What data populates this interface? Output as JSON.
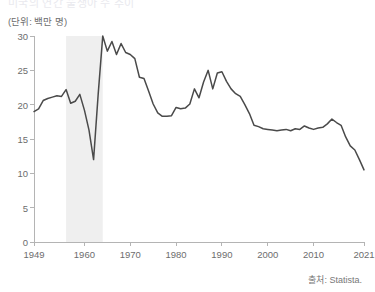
{
  "header": {
    "title": "미국의 연간 출생아 수 추이",
    "unit_label": "(단위: 백만 명)"
  },
  "footer": {
    "source": "출처: Statista."
  },
  "axes": {
    "y_ticks": [
      "0",
      "5",
      "10",
      "15",
      "20",
      "25",
      "30"
    ],
    "x_ticks": [
      "1949",
      "1960",
      "1970",
      "1980",
      "1990",
      "2000",
      "2010",
      "2021"
    ]
  },
  "colors": {
    "line": "#4a4a4a",
    "band": "#efefef",
    "axis": "#b4b4b4",
    "text": "#6d6d6d"
  },
  "chart_data": {
    "type": "line",
    "title": "미국의 연간 출생아 수 추이",
    "xlabel": "",
    "ylabel": "백만 명",
    "unit": "백만 명",
    "source": "출처: Statista.",
    "xlim": [
      1949,
      2021
    ],
    "ylim": [
      0,
      30
    ],
    "y_ticks": [
      0,
      5,
      10,
      15,
      20,
      25,
      30
    ],
    "x_ticks": [
      1949,
      1960,
      1970,
      1980,
      1990,
      2000,
      2010,
      2021
    ],
    "grid": false,
    "legend": "none",
    "highlight_bands": [
      {
        "x0": 1956,
        "x1": 1964,
        "color": "#efefef",
        "label": ""
      }
    ],
    "series": [
      {
        "name": "연간 출생아 수",
        "color": "#4a4a4a",
        "x": [
          1949,
          1950,
          1951,
          1952,
          1953,
          1954,
          1955,
          1956,
          1957,
          1958,
          1959,
          1960,
          1961,
          1962,
          1963,
          1964,
          1965,
          1966,
          1967,
          1968,
          1969,
          1970,
          1971,
          1972,
          1973,
          1974,
          1975,
          1976,
          1977,
          1978,
          1979,
          1980,
          1981,
          1982,
          1983,
          1984,
          1985,
          1986,
          1987,
          1988,
          1989,
          1990,
          1991,
          1992,
          1993,
          1994,
          1995,
          1996,
          1997,
          1998,
          1999,
          2000,
          2001,
          2002,
          2003,
          2004,
          2005,
          2006,
          2007,
          2008,
          2009,
          2010,
          2011,
          2012,
          2013,
          2014,
          2015,
          2016,
          2017,
          2018,
          2019,
          2020,
          2021
        ],
        "y": [
          19.0,
          19.4,
          20.6,
          20.9,
          21.1,
          21.3,
          21.2,
          22.2,
          20.2,
          20.5,
          21.5,
          19.2,
          16.3,
          12.0,
          21.5,
          30.0,
          27.8,
          29.2,
          27.3,
          28.9,
          27.6,
          27.3,
          26.7,
          24.0,
          23.8,
          22.0,
          20.1,
          18.8,
          18.3,
          18.3,
          18.4,
          19.6,
          19.4,
          19.5,
          20.1,
          22.3,
          21.0,
          23.3,
          25.0,
          22.3,
          24.6,
          24.8,
          23.4,
          22.3,
          21.6,
          21.2,
          20.0,
          18.7,
          17.0,
          16.8,
          16.5,
          16.4,
          16.3,
          16.2,
          16.3,
          16.4,
          16.2,
          16.5,
          16.4,
          16.9,
          16.6,
          16.4,
          16.6,
          16.7,
          17.2,
          17.9,
          17.4,
          17.0,
          15.3,
          14.0,
          13.4,
          12.0,
          10.5
        ]
      }
    ]
  }
}
